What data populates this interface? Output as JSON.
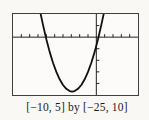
{
  "figure": {
    "caption": "[−10, 5] by [−25, 10]"
  },
  "chart_data": {
    "type": "line",
    "title": "",
    "xlabel": "",
    "ylabel": "",
    "window": {
      "xlim": [
        -10,
        5
      ],
      "ylim": [
        -25,
        10
      ],
      "xscl": 1,
      "yscl": 5
    },
    "axes": {
      "x_axis": true,
      "y_axis": true,
      "grid": false,
      "tick_style": "calculator"
    },
    "series": [
      {
        "name": "parabola",
        "description": "Upward-opening parabola, vertex ≈ (−2.9, −23.5), x-intercepts ≈ −6.1 and 0.3, approx y = 2.35(x+2.9)² − 23.5",
        "points": [
          [
            -6.68,
            10
          ],
          [
            -6.4,
            5.29
          ],
          [
            -6.0,
            -0.92
          ],
          [
            -5.6,
            -6.37
          ],
          [
            -5.2,
            -11.07
          ],
          [
            -4.8,
            -15.02
          ],
          [
            -4.4,
            -18.21
          ],
          [
            -4.0,
            -20.66
          ],
          [
            -3.6,
            -22.35
          ],
          [
            -3.2,
            -23.29
          ],
          [
            -2.9,
            -23.5
          ],
          [
            -2.6,
            -23.29
          ],
          [
            -2.2,
            -22.35
          ],
          [
            -1.8,
            -20.66
          ],
          [
            -1.4,
            -18.21
          ],
          [
            -1.0,
            -15.02
          ],
          [
            -0.6,
            -11.07
          ],
          [
            -0.2,
            -6.37
          ],
          [
            0.2,
            -0.92
          ],
          [
            0.6,
            5.29
          ],
          [
            0.88,
            10
          ]
        ]
      }
    ],
    "legend": false,
    "caption": "[−10, 5] by [−25, 10]"
  },
  "colors": {
    "background": "#faf8f5",
    "frame": "#3f3f3f",
    "axis": "#222222",
    "curve": "#111111",
    "text": "#1a1a1a"
  }
}
